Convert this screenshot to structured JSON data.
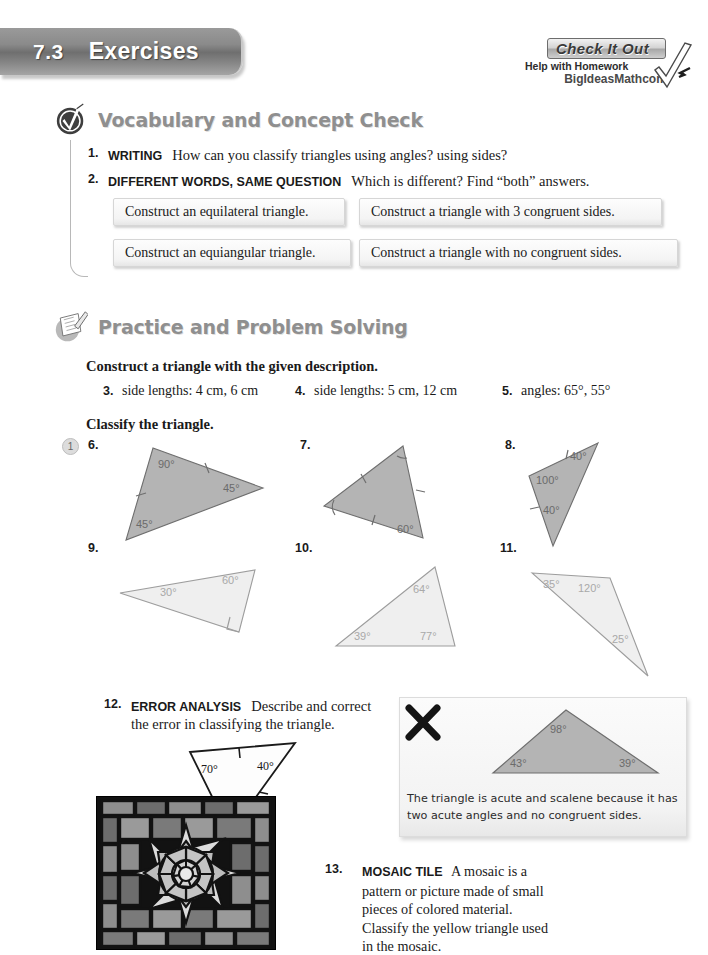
{
  "header": {
    "section_number": "7.3",
    "title": "Exercises"
  },
  "check_it_out": {
    "title": "Check It Out",
    "subtitle": "Help with Homework",
    "url": "BigIdeasMath",
    "url_suffix": "com"
  },
  "vocabulary_section": {
    "heading": "Vocabulary and Concept Check",
    "icon": "checkmark-badge-icon",
    "questions": [
      {
        "number": "1.",
        "tag": "WRITING",
        "text": "How can you classify triangles using angles? using sides?"
      },
      {
        "number": "2.",
        "tag": "DIFFERENT WORDS, SAME QUESTION",
        "text": "Which is different? Find “both” answers."
      }
    ],
    "choices": [
      "Construct an equilateral triangle.",
      "Construct a triangle with 3 congruent sides.",
      "Construct an equiangular triangle.",
      "Construct a triangle with no congruent sides."
    ]
  },
  "practice_section": {
    "heading": "Practice and Problem Solving",
    "icon": "notepad-pencil-icon",
    "instruction_construct": "Construct a triangle with the given description.",
    "construct_items": [
      {
        "number": "3.",
        "text": "side lengths: 4 cm, 6 cm"
      },
      {
        "number": "4.",
        "text": "side lengths: 5 cm, 12 cm"
      },
      {
        "number": "5.",
        "text": "angles: 65°, 55°"
      }
    ],
    "instruction_classify": "Classify the triangle.",
    "example_bubble": "1",
    "figures": [
      {
        "number": "6.",
        "shade": "dark",
        "angles": [
          "90°",
          "45°",
          "45°"
        ],
        "tick_marks": 2
      },
      {
        "number": "7.",
        "shade": "dark",
        "angles": [
          "60°"
        ],
        "tick_marks": 3
      },
      {
        "number": "8.",
        "shade": "dark",
        "angles": [
          "40°",
          "100°",
          "40°"
        ],
        "tick_marks": 2
      },
      {
        "number": "9.",
        "shade": "light",
        "angles": [
          "60°",
          "30°"
        ],
        "right_angle_mark": true
      },
      {
        "number": "10.",
        "shade": "light",
        "angles": [
          "64°",
          "39°",
          "77°"
        ]
      },
      {
        "number": "11.",
        "shade": "light",
        "angles": [
          "35°",
          "120°",
          "25°"
        ]
      }
    ]
  },
  "error_analysis": {
    "number": "12.",
    "tag": "ERROR ANALYSIS",
    "text": "Describe and correct the error in classifying the triangle.",
    "figure_angles": [
      "70°",
      "40°",
      "70°"
    ],
    "card": {
      "mark": "x-mark-icon",
      "triangle_angles": [
        "98°",
        "43°",
        "39°"
      ],
      "statement": "The triangle is acute and scalene because it has two acute angles and no congruent sides."
    }
  },
  "mosaic_question": {
    "number": "13.",
    "tag": "MOSAIC TILE",
    "text": "A mosaic is a pattern or picture made of small pieces of colored material. Classify the yellow triangle used in the mosaic.",
    "image_alt": "mosaic-tile-photo"
  },
  "colors": {
    "banner_gray": "#8a8a8a",
    "heading_gray": "#8f8f8f",
    "triangle_dark_fill": "#b4b4b4",
    "triangle_light_fill": "#efefef",
    "triangle_stroke": "#6e6e6e",
    "angle_text": "#6b6b6b"
  }
}
